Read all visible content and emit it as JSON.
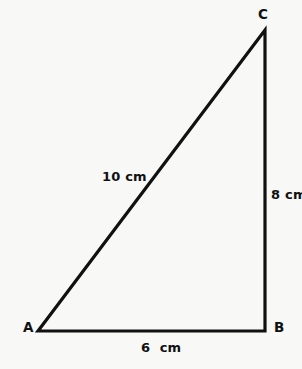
{
  "figure": {
    "kind": "right-triangle-diagram",
    "background_color": "#f8f8f6",
    "stroke_color": "#111111",
    "text_color": "#111111"
  },
  "vertices": [
    {
      "name": "A",
      "label": "A",
      "x": 38,
      "y": 331,
      "label_x": 23,
      "label_y": 321
    },
    {
      "name": "B",
      "label": "B",
      "x": 265,
      "y": 331,
      "label_x": 274,
      "label_y": 321
    },
    {
      "name": "C",
      "label": "C",
      "x": 265,
      "y": 30,
      "label_x": 258,
      "label_y": 8
    }
  ],
  "sides": [
    {
      "name": "AC",
      "label": "10 cm",
      "length": 10,
      "unit": "cm",
      "role": "hypotenuse"
    },
    {
      "name": "BC",
      "label": "8 cm",
      "length": 8,
      "unit": "cm",
      "role": "vertical-leg"
    },
    {
      "name": "AB",
      "label": "6  cm",
      "length": 6,
      "unit": "cm",
      "role": "horizontal-leg"
    }
  ],
  "geometry": {
    "path_points": "38,331 265,30 265,331",
    "stroke_width": 3.2
  }
}
